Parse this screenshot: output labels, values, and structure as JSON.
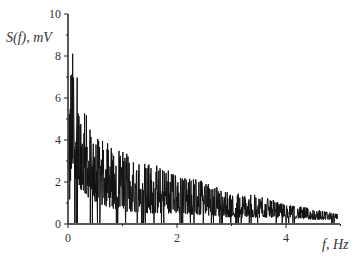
{
  "chart_data": {
    "type": "line",
    "title": "",
    "xlabel": "f, Hz",
    "ylabel": "S(f), mV",
    "xlim": [
      0,
      5
    ],
    "ylim": [
      0,
      10
    ],
    "x_ticks": [
      0,
      2,
      4
    ],
    "y_ticks": [
      0,
      2,
      4,
      6,
      8,
      10
    ],
    "grid": false,
    "legend": null,
    "series": [
      {
        "name": "S(f)",
        "color": "#111111",
        "description": "noisy decaying spectrum; approximate upper envelope",
        "x": [
          0.02,
          0.05,
          0.1,
          0.15,
          0.2,
          0.3,
          0.5,
          0.75,
          1.0,
          1.5,
          2.0,
          2.5,
          3.0,
          3.5,
          4.0,
          4.5,
          4.95
        ],
        "peak_values": [
          5.0,
          9.2,
          9.0,
          8.8,
          6.5,
          6.0,
          4.5,
          4.2,
          3.8,
          3.2,
          2.6,
          2.2,
          1.6,
          1.5,
          1.0,
          0.8,
          0.5
        ],
        "baseline_values": [
          0.5,
          1.5,
          2.5,
          2.0,
          1.8,
          1.4,
          1.0,
          0.8,
          0.6,
          0.5,
          0.5,
          0.4,
          0.3,
          0.3,
          0.3,
          0.2,
          0.2
        ]
      }
    ]
  },
  "axes": {
    "y_label": "S(f), mV",
    "x_label": "f, Hz",
    "y_tick_labels": [
      "0",
      "2",
      "4",
      "6",
      "8",
      "10"
    ],
    "x_tick_labels": [
      "0",
      "2",
      "4"
    ]
  }
}
